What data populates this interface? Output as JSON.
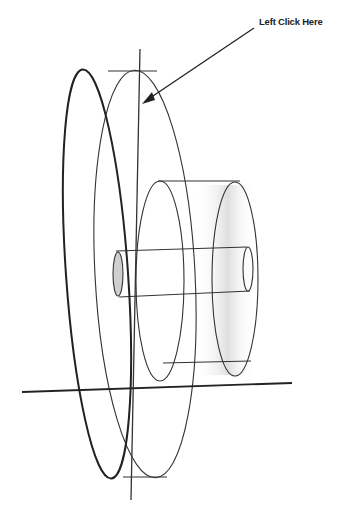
{
  "diagram": {
    "callout": {
      "label": "Left Click Here",
      "target": "front disc outer edge"
    },
    "colors": {
      "line": "#333333",
      "bold_line": "#222222",
      "shade": "#d8d8d8",
      "background": "#ffffff"
    },
    "parts": [
      "front-disc",
      "back-disc",
      "hub-cylinder",
      "shaft",
      "vertical-axis",
      "horizontal-axis"
    ]
  }
}
